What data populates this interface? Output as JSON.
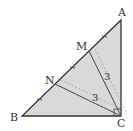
{
  "diagram": {
    "points": {
      "A": {
        "label": "A",
        "x": 121,
        "y": 20
      },
      "B": {
        "label": "B",
        "x": 22,
        "y": 116
      },
      "C": {
        "label": "C",
        "x": 121,
        "y": 116
      },
      "M": {
        "label": "M",
        "x": 89,
        "y": 51
      },
      "N": {
        "label": "N",
        "x": 55,
        "y": 84
      }
    },
    "labels": {
      "A": "A",
      "B": "B",
      "C": "C",
      "M": "M",
      "N": "N",
      "len_mc": "3",
      "len_nc": "3"
    },
    "colors": {
      "fill": "#d9d9d9",
      "stroke": "#333333",
      "dashed": "#777777"
    }
  }
}
